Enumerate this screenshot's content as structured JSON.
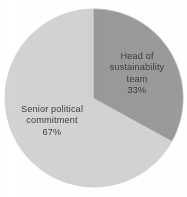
{
  "chart_data": {
    "type": "pie",
    "title": "",
    "categories": [
      "Head of sustainability team",
      "Senior political commitment"
    ],
    "values": [
      33,
      67
    ],
    "unit": "%",
    "legend": "none",
    "labels_inside": true,
    "start_angle_deg": 0,
    "direction": "clockwise",
    "slices": [
      {
        "name": "Head of sustainability team",
        "value": 33,
        "value_text": "33%",
        "color": "#9a9a9a",
        "label_lines": [
          "Head of",
          "sustainability",
          "team"
        ],
        "start_angle_deg": 0,
        "end_angle_deg": 118.8
      },
      {
        "name": "Senior political commitment",
        "value": 67,
        "value_text": "67%",
        "color": "#d3d3d3",
        "label_lines": [
          "Senior political",
          "commitment"
        ],
        "start_angle_deg": 118.8,
        "end_angle_deg": 360
      }
    ]
  },
  "figure": {
    "background_color": "#ffffff",
    "text_color": "#3c3c3c",
    "center_x": 94,
    "center_y": 98,
    "radius": 89
  },
  "slice_a": {
    "line1": "Head of",
    "line2": "sustainability",
    "line3": "team",
    "value_text": "33%"
  },
  "slice_b": {
    "line1": "Senior political",
    "line2": "commitment",
    "value_text": "67%"
  }
}
